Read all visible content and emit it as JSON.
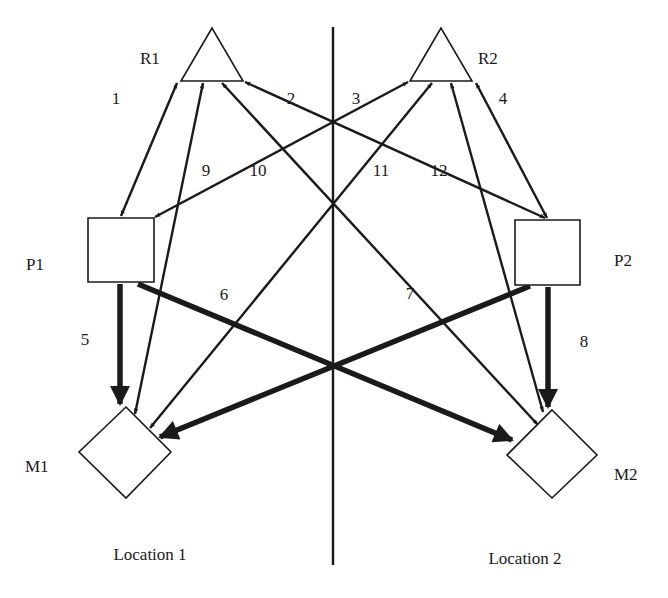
{
  "diagram": {
    "title": "",
    "colors": {
      "ink": "#1a1a1a",
      "background": "#ffffff"
    },
    "divider": {
      "x": 333,
      "y1": 27,
      "y2": 565
    },
    "locations": [
      {
        "id": "loc1",
        "label": "Location 1",
        "x": 150,
        "y": 560
      },
      {
        "id": "loc2",
        "label": "Location 2",
        "x": 525,
        "y": 564
      }
    ],
    "nodes": [
      {
        "id": "R1",
        "label": "R1",
        "shape": "triangle",
        "points": "212,28 181,81 243,81",
        "label_x": 140,
        "label_y": 64
      },
      {
        "id": "R2",
        "label": "R2",
        "shape": "triangle",
        "points": "441,28 410,81 472,81",
        "label_x": 478,
        "label_y": 64
      },
      {
        "id": "P1",
        "label": "P1",
        "shape": "square",
        "points": "88,218 154,218 154,282 88,282",
        "label_x": 26,
        "label_y": 270
      },
      {
        "id": "P2",
        "label": "P2",
        "shape": "square",
        "points": "515,220 580,220 580,285 515,285",
        "label_x": 614,
        "label_y": 266
      },
      {
        "id": "M1",
        "label": "M1",
        "shape": "diamond",
        "points": "126,407 171,452 126,498 79,452",
        "label_x": 25,
        "label_y": 472
      },
      {
        "id": "M2",
        "label": "M2",
        "shape": "diamond",
        "points": "552,410 597,455 552,498 507,455",
        "label_x": 614,
        "label_y": 480
      }
    ],
    "edges": [
      {
        "id": "e1",
        "label": "1",
        "from": "R1",
        "to": "P1",
        "weight": "thin",
        "x1": 177,
        "y1": 83,
        "x2": 121,
        "y2": 216,
        "heads": "both",
        "label_x": 116,
        "label_y": 104
      },
      {
        "id": "e2",
        "label": "2",
        "from": "P2",
        "to": "R1",
        "weight": "thin",
        "x1": 545,
        "y1": 218,
        "x2": 245,
        "y2": 82,
        "heads": "both",
        "label_x": 291,
        "label_y": 104
      },
      {
        "id": "e3",
        "label": "3",
        "from": "P1",
        "to": "R2",
        "weight": "thin",
        "x1": 155,
        "y1": 217,
        "x2": 408,
        "y2": 82,
        "heads": "both",
        "label_x": 356,
        "label_y": 104
      },
      {
        "id": "e4",
        "label": "4",
        "from": "R2",
        "to": "P2",
        "weight": "thin",
        "x1": 476,
        "y1": 83,
        "x2": 547,
        "y2": 218,
        "heads": "both",
        "label_x": 503,
        "label_y": 104
      },
      {
        "id": "e5",
        "label": "5",
        "from": "P1",
        "to": "M1",
        "weight": "thick",
        "x1": 120,
        "y1": 284,
        "x2": 120,
        "y2": 404,
        "heads": "end",
        "label_x": 85,
        "label_y": 345
      },
      {
        "id": "e6",
        "label": "6",
        "from": "P1",
        "to": "M2",
        "weight": "thick",
        "x1": 138,
        "y1": 284,
        "x2": 512,
        "y2": 440,
        "heads": "end",
        "label_x": 224,
        "label_y": 300
      },
      {
        "id": "e7",
        "label": "7",
        "from": "P2",
        "to": "M1",
        "weight": "thick",
        "x1": 530,
        "y1": 286,
        "x2": 160,
        "y2": 437,
        "heads": "end",
        "label_x": 410,
        "label_y": 299
      },
      {
        "id": "e8",
        "label": "8",
        "from": "P2",
        "to": "M2",
        "weight": "thick",
        "x1": 548,
        "y1": 287,
        "x2": 548,
        "y2": 407,
        "heads": "end",
        "label_x": 584,
        "label_y": 347
      },
      {
        "id": "e9",
        "label": "9",
        "from": "M1",
        "to": "R1",
        "weight": "thin",
        "x1": 135,
        "y1": 414,
        "x2": 203,
        "y2": 83,
        "heads": "both",
        "label_x": 206,
        "label_y": 176
      },
      {
        "id": "e10",
        "label": "10",
        "from": "M2",
        "to": "R1",
        "weight": "thin",
        "x1": 538,
        "y1": 425,
        "x2": 222,
        "y2": 83,
        "heads": "both",
        "label_x": 258,
        "label_y": 176
      },
      {
        "id": "e11",
        "label": "11",
        "from": "M1",
        "to": "R2",
        "weight": "thin",
        "x1": 150,
        "y1": 428,
        "x2": 432,
        "y2": 83,
        "heads": "both",
        "label_x": 381,
        "label_y": 176
      },
      {
        "id": "e12",
        "label": "12",
        "from": "M2",
        "to": "R2",
        "weight": "thin",
        "x1": 543,
        "y1": 412,
        "x2": 451,
        "y2": 83,
        "heads": "both",
        "label_x": 439,
        "label_y": 176
      }
    ]
  }
}
